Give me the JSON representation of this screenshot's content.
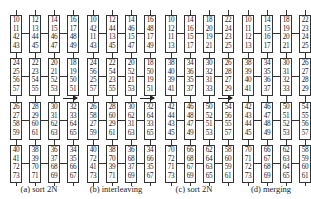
{
  "panels": [
    {
      "caption": "(a)  sort 2N",
      "rows": [
        [
          [
            "10",
            "11",
            "42",
            "43"
          ],
          [
            "12",
            "13",
            "44",
            "45"
          ],
          [
            "14",
            "15",
            "46",
            "47"
          ],
          [
            "16",
            "17",
            "48",
            "49"
          ]
        ],
        [
          [
            "24",
            "25",
            "56",
            "57"
          ],
          [
            "22",
            "23",
            "54",
            "55"
          ],
          [
            "20",
            "21",
            "52",
            "53"
          ],
          [
            "18",
            "19",
            "50",
            "51"
          ]
        ],
        [
          [
            "26",
            "27",
            "58",
            "59"
          ],
          [
            "28",
            "29",
            "60",
            "61"
          ],
          [
            "30",
            "31",
            "62",
            "63"
          ],
          [
            "32",
            "33",
            "64",
            "65"
          ]
        ],
        [
          [
            "40",
            "41",
            "72",
            "73"
          ],
          [
            "38",
            "39",
            "70",
            "71"
          ],
          [
            "36",
            "37",
            "68",
            "69"
          ],
          [
            "34",
            "35",
            "66",
            "67"
          ]
        ]
      ]
    },
    {
      "caption": "(b)  interleaving",
      "rows": [
        [
          [
            "10",
            "42",
            "11",
            "43"
          ],
          [
            "12",
            "44",
            "13",
            "45"
          ],
          [
            "14",
            "46",
            "15",
            "47"
          ],
          [
            "16",
            "48",
            "17",
            "49"
          ]
        ],
        [
          [
            "24",
            "56",
            "25",
            "57"
          ],
          [
            "22",
            "54",
            "23",
            "55"
          ],
          [
            "20",
            "52",
            "21",
            "53"
          ],
          [
            "18",
            "50",
            "19",
            "51"
          ]
        ],
        [
          [
            "26",
            "58",
            "27",
            "59"
          ],
          [
            "28",
            "60",
            "29",
            "61"
          ],
          [
            "30",
            "62",
            "31",
            "63"
          ],
          [
            "32",
            "64",
            "33",
            "65"
          ]
        ],
        [
          [
            "40",
            "72",
            "41",
            "73"
          ],
          [
            "38",
            "70",
            "39",
            "71"
          ],
          [
            "36",
            "68",
            "37",
            "69"
          ],
          [
            "34",
            "66",
            "35",
            "67"
          ]
        ]
      ]
    },
    {
      "caption": "(c)  sort 2N",
      "rows": [
        [
          [
            "10",
            "12",
            "11",
            "13"
          ],
          [
            "14",
            "16",
            "15",
            "17"
          ],
          [
            "18",
            "20",
            "19",
            "21"
          ],
          [
            "22",
            "24",
            "23",
            "25"
          ]
        ],
        [
          [
            "38",
            "40",
            "39",
            "41"
          ],
          [
            "34",
            "36",
            "35",
            "37"
          ],
          [
            "30",
            "32",
            "31",
            "33"
          ],
          [
            "26",
            "28",
            "27",
            "29"
          ]
        ],
        [
          [
            "42",
            "44",
            "43",
            "45"
          ],
          [
            "46",
            "48",
            "47",
            "49"
          ],
          [
            "50",
            "52",
            "51",
            "53"
          ],
          [
            "54",
            "56",
            "55",
            "57"
          ]
        ],
        [
          [
            "70",
            "72",
            "71",
            "73"
          ],
          [
            "66",
            "68",
            "67",
            "69"
          ],
          [
            "62",
            "64",
            "63",
            "65"
          ],
          [
            "58",
            "60",
            "59",
            "61"
          ]
        ]
      ]
    },
    {
      "caption": "(d)  merging",
      "rows": [
        [
          [
            "10",
            "11",
            "12",
            "13"
          ],
          [
            "14",
            "15",
            "16",
            "17"
          ],
          [
            "18",
            "19",
            "20",
            "21"
          ],
          [
            "22",
            "23",
            "24",
            "25"
          ]
        ],
        [
          [
            "38",
            "39",
            "40",
            "41"
          ],
          [
            "34",
            "35",
            "36",
            "37"
          ],
          [
            "30",
            "31",
            "32",
            "33"
          ],
          [
            "26",
            "27",
            "28",
            "29"
          ]
        ],
        [
          [
            "42",
            "43",
            "44",
            "45"
          ],
          [
            "46",
            "47",
            "48",
            "49"
          ],
          [
            "50",
            "51",
            "52",
            "53"
          ],
          [
            "54",
            "55",
            "56",
            "57"
          ]
        ],
        [
          [
            "70",
            "71",
            "72",
            "73"
          ],
          [
            "66",
            "67",
            "68",
            "69"
          ],
          [
            "62",
            "63",
            "64",
            "65"
          ],
          [
            "58",
            "59",
            "60",
            "61"
          ]
        ]
      ]
    }
  ],
  "arrows": [
    {
      "from": "a",
      "to": "b"
    },
    {
      "from": "b",
      "to": "c"
    },
    {
      "from": "c",
      "to": "d"
    }
  ]
}
